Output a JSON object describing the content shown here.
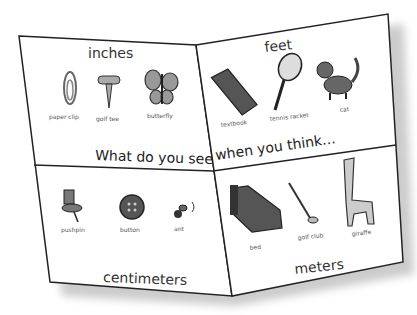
{
  "worksheet": {
    "top_left": {
      "title": "inches",
      "items": [
        {
          "label": "paper clip",
          "icon": "paper-clip-icon"
        },
        {
          "label": "golf tee",
          "icon": "golf-tee-icon"
        },
        {
          "label": "butterfly",
          "icon": "butterfly-icon"
        }
      ]
    },
    "top_right": {
      "title": "feet",
      "items": [
        {
          "label": "textbook",
          "icon": "textbook-icon"
        },
        {
          "label": "tennis racket",
          "icon": "tennis-racket-icon"
        },
        {
          "label": "cat",
          "icon": "cat-icon"
        }
      ]
    },
    "bottom_left": {
      "title": "centimeters",
      "items": [
        {
          "label": "pushpin",
          "icon": "pushpin-icon"
        },
        {
          "label": "button",
          "icon": "button-icon"
        },
        {
          "label": "ant",
          "icon": "ant-icon"
        }
      ]
    },
    "bottom_right": {
      "title": "meters",
      "items": [
        {
          "label": "bed",
          "icon": "bed-icon"
        },
        {
          "label": "golf club",
          "icon": "golf-club-icon"
        },
        {
          "label": "giraffe",
          "icon": "giraffe-icon"
        }
      ]
    },
    "phrase_left": "What do you see",
    "phrase_right": "when you think..."
  }
}
